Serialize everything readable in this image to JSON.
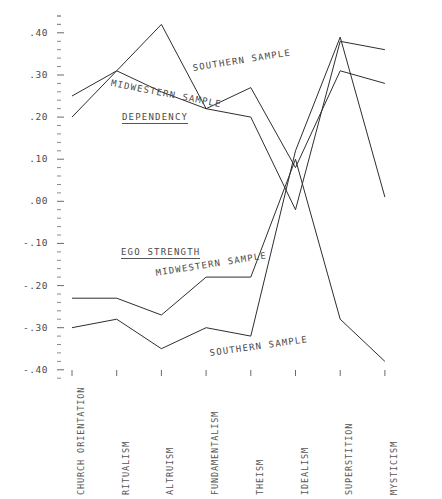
{
  "chart_data": {
    "type": "line",
    "title": "",
    "xlabel": "",
    "ylabel": "",
    "ylim": [
      -0.4,
      0.45
    ],
    "grid": false,
    "legend": "inline-annotations",
    "categories": [
      "CHURCH ORIENTATION",
      "RITUALISM",
      "ALTRUISM",
      "FUNDAMENTALISM",
      "THEISM",
      "IDEALISM",
      "SUPERSTITION",
      "MYSTICISM"
    ],
    "ytick_labels": [
      ".40",
      ".30",
      ".20",
      ".10",
      ".00",
      "-.10",
      "-.20",
      "-.30",
      "-.40"
    ],
    "ytick_values": [
      0.4,
      0.3,
      0.2,
      0.1,
      0.0,
      -0.1,
      -0.2,
      -0.3,
      -0.4
    ],
    "ytick_minor_step": 0.02,
    "series": [
      {
        "name": "DEPENDENCY - MIDWESTERN SAMPLE",
        "group": "DEPENDENCY",
        "sample": "MIDWESTERN SAMPLE",
        "values": [
          0.25,
          0.31,
          0.26,
          0.22,
          0.2,
          -0.02,
          0.38,
          0.36
        ]
      },
      {
        "name": "DEPENDENCY - SOUTHERN SAMPLE",
        "group": "DEPENDENCY",
        "sample": "SOUTHERN SAMPLE",
        "values": [
          0.2,
          0.31,
          0.42,
          0.22,
          0.27,
          0.08,
          0.31,
          0.28
        ]
      },
      {
        "name": "EGO STRENGTH - MIDWESTERN SAMPLE",
        "group": "EGO STRENGTH",
        "sample": "MIDWESTERN SAMPLE",
        "values": [
          -0.23,
          -0.23,
          -0.27,
          -0.18,
          -0.18,
          0.1,
          -0.28,
          -0.38
        ]
      },
      {
        "name": "EGO STRENGTH - SOUTHERN SAMPLE",
        "group": "EGO STRENGTH",
        "sample": "SOUTHERN SAMPLE",
        "values": [
          -0.3,
          -0.28,
          -0.35,
          -0.3,
          -0.32,
          0.12,
          0.39,
          0.01
        ]
      }
    ],
    "annotations": [
      {
        "text": "DEPENDENCY",
        "underlined": true
      },
      {
        "text": "MIDWESTERN SAMPLE",
        "underlined": false
      },
      {
        "text": "SOUTHERN SAMPLE",
        "underlined": false
      },
      {
        "text": "EGO STRENGTH",
        "underlined": true
      },
      {
        "text": "MIDWESTERN SAMPLE",
        "underlined": false
      },
      {
        "text": "SOUTHERN SAMPLE",
        "underlined": false
      }
    ]
  },
  "axis": {
    "y_labels": [
      {
        "text": ".40"
      },
      {
        "text": ".30"
      },
      {
        "text": ".20"
      },
      {
        "text": ".10"
      },
      {
        "text": ".00"
      },
      {
        "text": "-.10"
      },
      {
        "text": "-.20"
      },
      {
        "text": "-.30"
      },
      {
        "text": "-.40"
      }
    ],
    "x_labels": [
      {
        "text": "CHURCH ORIENTATION"
      },
      {
        "text": "RITUALISM"
      },
      {
        "text": "ALTRUISM"
      },
      {
        "text": "FUNDAMENTALISM"
      },
      {
        "text": "THEISM"
      },
      {
        "text": "IDEALISM"
      },
      {
        "text": "SUPERSTITION"
      },
      {
        "text": "MYSTICISM"
      }
    ]
  },
  "labels": {
    "dependency": "DEPENDENCY",
    "dep_midwestern": "MIDWESTERN SAMPLE",
    "dep_southern": "SOUTHERN SAMPLE",
    "ego_strength": "EGO STRENGTH",
    "ego_midwestern": "MIDWESTERN SAMPLE",
    "ego_southern": "SOUTHERN SAMPLE"
  },
  "style": {
    "line_color": "#2e2e2e",
    "text_color": "#4a4a4a",
    "background": "#ffffff"
  }
}
